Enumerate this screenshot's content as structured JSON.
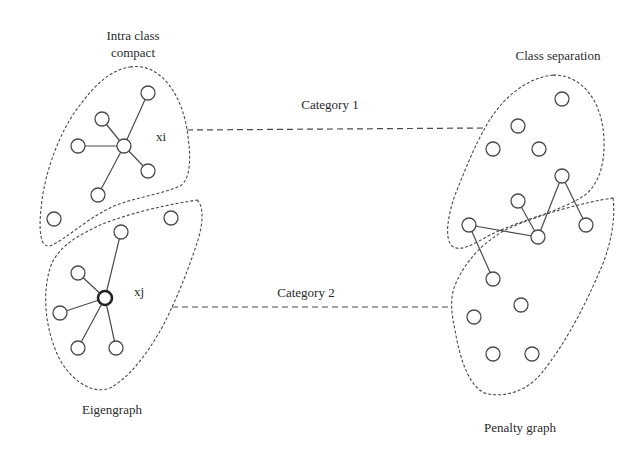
{
  "labels": {
    "intra_class_line1": "Intra class",
    "intra_class_line2": "compact",
    "class_separation": "Class separation",
    "category_1": "Category 1",
    "category_2": "Category 2",
    "xi": "xi",
    "xj": "xj",
    "eigengraph": "Eigengraph",
    "penalty_graph": "Penalty graph"
  },
  "colors": {
    "stroke": "#4a4a4a",
    "text": "#2a2a2a",
    "background": "#ffffff"
  },
  "eigengraph": {
    "category_1_cluster": {
      "center_node": "xi",
      "neighbor_count": 5,
      "isolated_nodes": 2
    },
    "category_2_cluster": {
      "center_node": "xj",
      "neighbor_count": 5,
      "isolated_nodes": 1
    }
  },
  "penalty_graph": {
    "category_1_nodes": 4,
    "shared_connected_nodes": 6,
    "category_2_nodes": 5
  }
}
